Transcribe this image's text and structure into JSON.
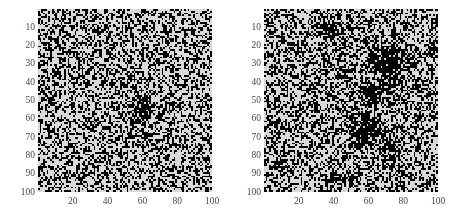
{
  "figure": {
    "background_color": "#ffffff",
    "noise_background_color": "#d9d9d9",
    "noise_foreground_color": "#000000",
    "tick_label_color": "#4a4a4a"
  },
  "chart_data": [
    {
      "type": "heatmap",
      "panel_name": "left-panel",
      "title": "",
      "xlabel": "",
      "ylabel": "",
      "xlim": [
        0,
        100
      ],
      "ylim": [
        100,
        0
      ],
      "grid": false,
      "legend": "none",
      "xticks": [
        20,
        40,
        60,
        80,
        100
      ],
      "yticks": [
        10,
        20,
        30,
        40,
        50,
        60,
        70,
        80,
        90,
        100
      ],
      "values_binary": true,
      "background_density": 0.42,
      "cluster_density": 0.93,
      "grid_size": [
        100,
        100
      ],
      "clusters": [
        {
          "cx": 60,
          "cy": 55,
          "rx": 11,
          "ry": 16,
          "shape": "diamond",
          "density": 0.93
        }
      ],
      "halo": {
        "cx": 60,
        "cy": 55,
        "rx": 26,
        "ry": 30,
        "density": 0.52
      },
      "seed": 20407
    },
    {
      "type": "heatmap",
      "panel_name": "right-panel",
      "title": "",
      "xlabel": "",
      "ylabel": "",
      "xlim": [
        0,
        100
      ],
      "ylim": [
        100,
        0
      ],
      "grid": false,
      "legend": "none",
      "xticks": [
        20,
        40,
        60,
        80,
        100
      ],
      "yticks": [
        10,
        20,
        30,
        40,
        50,
        60,
        70,
        80,
        90,
        100
      ],
      "values_binary": true,
      "background_density": 0.44,
      "cluster_density": 0.92,
      "grid_size": [
        100,
        100
      ],
      "clusters": [
        {
          "cx": 36,
          "cy": 11,
          "rx": 14,
          "ry": 9,
          "shape": "ellipse",
          "density": 0.88
        },
        {
          "cx": 72,
          "cy": 30,
          "rx": 19,
          "ry": 17,
          "shape": "ellipse",
          "density": 0.93
        },
        {
          "cx": 63,
          "cy": 47,
          "rx": 13,
          "ry": 11,
          "shape": "ellipse",
          "density": 0.86
        },
        {
          "cx": 58,
          "cy": 66,
          "rx": 18,
          "ry": 14,
          "shape": "ellipse",
          "density": 0.9
        },
        {
          "cx": 74,
          "cy": 76,
          "rx": 10,
          "ry": 9,
          "shape": "ellipse",
          "density": 0.85
        },
        {
          "cx": 41,
          "cy": 93,
          "rx": 10,
          "ry": 7,
          "shape": "ellipse",
          "density": 0.88
        },
        {
          "cx": 95,
          "cy": 22,
          "rx": 8,
          "ry": 8,
          "shape": "ellipse",
          "density": 0.8
        }
      ],
      "halo": {
        "cx": 62,
        "cy": 50,
        "rx": 40,
        "ry": 46,
        "density": 0.5
      },
      "seed": 91733
    }
  ],
  "panels": [
    {
      "name": "left-panel",
      "plot_rect": {
        "left": 38,
        "top": 9,
        "width": 174,
        "height": 183
      },
      "ytick_labels": [
        "10",
        "20",
        "30",
        "40",
        "50",
        "60",
        "70",
        "80",
        "90",
        "100"
      ],
      "xtick_labels": [
        "20",
        "40",
        "60",
        "80",
        "100"
      ]
    },
    {
      "name": "right-panel",
      "plot_rect": {
        "left": 37,
        "top": 9,
        "width": 174,
        "height": 183
      },
      "ytick_labels": [
        "10",
        "20",
        "30",
        "40",
        "50",
        "60",
        "70",
        "80",
        "90",
        "100"
      ],
      "xtick_labels": [
        "20",
        "40",
        "60",
        "80",
        "100"
      ]
    }
  ]
}
